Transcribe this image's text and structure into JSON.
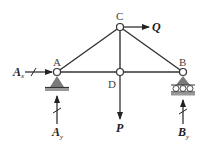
{
  "diagram": {
    "type": "truss",
    "nodes": [
      {
        "id": "A",
        "label": "A",
        "x": 57,
        "y": 72,
        "support": "pin"
      },
      {
        "id": "B",
        "label": "B",
        "x": 183,
        "y": 72,
        "support": "roller"
      },
      {
        "id": "C",
        "label": "C",
        "x": 120,
        "y": 27,
        "support": "none"
      },
      {
        "id": "D",
        "label": "D",
        "x": 120,
        "y": 72,
        "support": "none"
      }
    ],
    "members": [
      [
        "A",
        "C"
      ],
      [
        "C",
        "B"
      ],
      [
        "A",
        "D"
      ],
      [
        "D",
        "B"
      ],
      [
        "C",
        "D"
      ]
    ],
    "loads": [
      {
        "name": "Q",
        "label": "Q",
        "at": "C",
        "direction": "right"
      },
      {
        "name": "P",
        "label": "P",
        "at": "D",
        "direction": "down"
      }
    ],
    "reactions": [
      {
        "name": "Ax",
        "label": "A",
        "subscript": "x",
        "at": "A",
        "direction": "right"
      },
      {
        "name": "Ay",
        "label": "A",
        "subscript": "y",
        "at": "A",
        "direction": "up"
      },
      {
        "name": "By",
        "label": "B",
        "subscript": "y",
        "at": "B",
        "direction": "up"
      }
    ],
    "colors": {
      "member": "#333333",
      "support": "#7a7a7a",
      "ground": "#555555",
      "label": "#444444"
    }
  }
}
